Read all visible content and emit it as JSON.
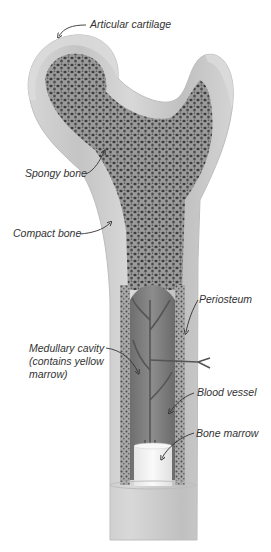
{
  "labels": {
    "articular_cartilage": "Articular cartilage",
    "spongy_bone": "Spongy bone",
    "compact_bone": "Compact bone",
    "periosteum": "Periosteum",
    "medullary_cavity_line1": "Medullary cavity",
    "medullary_cavity_line2": "(contains yellow",
    "medullary_cavity_line3": "marrow)",
    "blood_vessel": "Blood vessel",
    "bone_marrow": "Bone marrow"
  },
  "colors": {
    "background": "#ffffff",
    "cartilage": "#d9d9d9",
    "compact_bone": "#c8c8c8",
    "spongy_bone": "#8a8a8a",
    "pore": "#3c3c3c",
    "cavity": "#7a7a7a",
    "vessel": "#5a5a5a",
    "marrow": "#f2f2f2",
    "label_text": "#333333",
    "arrow": "#333333"
  }
}
